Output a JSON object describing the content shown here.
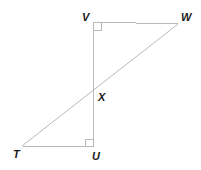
{
  "figure": {
    "name": "two-right-triangles-sharing-vertex-x",
    "background_color": "#ffffff",
    "line_color": "#b9b9b9",
    "line_width": 1,
    "label_color": "#1b1b1b",
    "label_font_size": 11,
    "points": {
      "V": {
        "label": "V",
        "x": 93,
        "y": 22
      },
      "W": {
        "label": "W",
        "x": 178,
        "y": 24
      },
      "X": {
        "label": "X",
        "x": 93,
        "y": 95
      },
      "T": {
        "label": "T",
        "x": 22,
        "y": 146
      },
      "U": {
        "label": "U",
        "x": 93,
        "y": 147
      }
    },
    "segments": [
      {
        "name": "segment-VW",
        "from": "V",
        "to": "W"
      },
      {
        "name": "segment-VU",
        "from": "V",
        "to": "U"
      },
      {
        "name": "segment-TU",
        "from": "T",
        "to": "U"
      },
      {
        "name": "segment-TW",
        "from": "T",
        "to": "W"
      }
    ],
    "right_angles": [
      {
        "name": "right-angle-marker-V",
        "at": "V",
        "size": 8,
        "dx": 1,
        "dy": 1
      },
      {
        "name": "right-angle-marker-U",
        "at": "U",
        "size": 8,
        "dx": -1,
        "dy": -1
      }
    ],
    "labels": {
      "V": "V",
      "W": "W",
      "X": "X",
      "T": "T",
      "U": "U"
    }
  }
}
